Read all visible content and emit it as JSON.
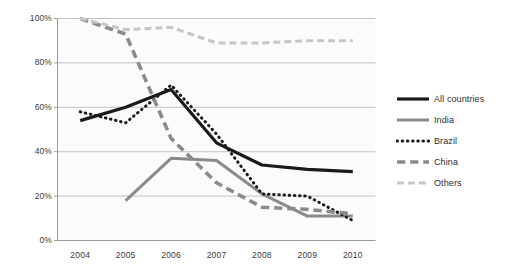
{
  "chart_data": {
    "type": "line",
    "title": "",
    "xlabel": "",
    "ylabel": "",
    "categories": [
      "2004",
      "2005",
      "2006",
      "2007",
      "2008",
      "2009",
      "2010"
    ],
    "x_tick_labels": [
      "2004",
      "2005",
      "2006",
      "2007",
      "2008",
      "2009",
      "2010"
    ],
    "y_tick_labels": [
      "0%",
      "20%",
      "40%",
      "60%",
      "80%",
      "100%"
    ],
    "y_tick_values": [
      0,
      20,
      40,
      60,
      80,
      100
    ],
    "ylim": [
      0,
      100
    ],
    "grid": "horizontal",
    "legend_position": "right",
    "series": [
      {
        "name": "All countries",
        "style": "solid",
        "color": "#1a1a1a",
        "width": 3.2,
        "values": [
          54,
          60,
          68,
          44,
          34,
          32,
          31
        ]
      },
      {
        "name": "India",
        "style": "solid",
        "color": "#8a8a8a",
        "width": 3.0,
        "values": [
          null,
          18,
          37,
          36,
          21,
          11,
          11
        ]
      },
      {
        "name": "Brazil",
        "style": "dotted",
        "color": "#1a1a1a",
        "width": 3.0,
        "values": [
          58,
          53,
          70,
          48,
          21,
          20,
          9
        ]
      },
      {
        "name": "China",
        "style": "dashed",
        "color": "#8a8a8a",
        "width": 3.6,
        "values": [
          100,
          93,
          46,
          26,
          15,
          14,
          12
        ]
      },
      {
        "name": "Others",
        "style": "dashed",
        "color": "#c6c6c6",
        "width": 3.0,
        "values": [
          100,
          95,
          96,
          89,
          89,
          90,
          90
        ]
      }
    ]
  },
  "legend": {
    "items": [
      {
        "label": "All countries"
      },
      {
        "label": "India"
      },
      {
        "label": "Brazil"
      },
      {
        "label": "China"
      },
      {
        "label": "Others"
      }
    ]
  },
  "colors": {
    "plot_background": "#fbfbfb",
    "gridline": "#b4b4b4",
    "axis": "#9a9a9a",
    "tick_text": "#3a3a3a"
  }
}
